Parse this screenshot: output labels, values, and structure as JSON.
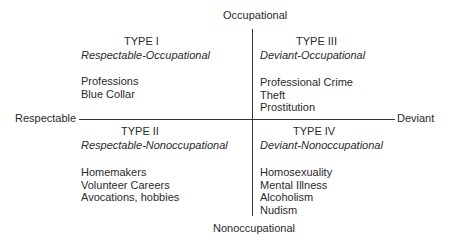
{
  "axes": {
    "top": "Occupational",
    "bottom": "Nonoccupational",
    "left": "Respectable",
    "right": "Deviant"
  },
  "quadrants": [
    {
      "type": "TYPE I",
      "subtitle": "Respectable-Occupational",
      "items": [
        "Professions",
        "Blue Collar"
      ]
    },
    {
      "type": "TYPE II",
      "subtitle": "Respectable-Nonoccupational",
      "items": [
        "Homemakers",
        "Volunteer Careers",
        "Avocations, hobbies"
      ]
    },
    {
      "type": "TYPE III",
      "subtitle": "Deviant-Occupational",
      "items": [
        "Professional Crime",
        "Theft",
        "Prostitution"
      ]
    },
    {
      "type": "TYPE IV",
      "subtitle": "Deviant-Nonoccupational",
      "items": [
        "Homosexuality",
        "Mental Illness",
        "Alcoholism",
        "Nudism"
      ]
    }
  ]
}
